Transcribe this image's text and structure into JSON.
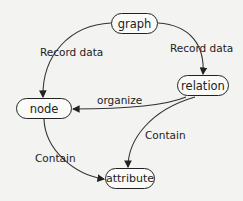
{
  "diagram": {
    "nodes": {
      "graph": "graph",
      "relation": "relation",
      "node": "node",
      "attribute": "attribute"
    },
    "edges": [
      {
        "from": "graph",
        "to": "node",
        "label": "Record data"
      },
      {
        "from": "graph",
        "to": "relation",
        "label": "Record data"
      },
      {
        "from": "relation",
        "to": "node",
        "label": "organize"
      },
      {
        "from": "relation",
        "to": "attribute",
        "label": "Contain"
      },
      {
        "from": "node",
        "to": "attribute",
        "label": "Contain"
      }
    ]
  }
}
